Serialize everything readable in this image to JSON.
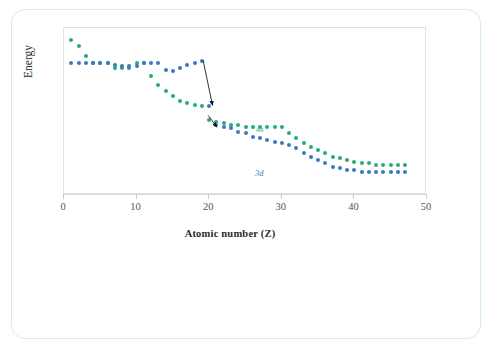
{
  "card": {
    "border_color": "#cfeeee"
  },
  "chart_data": {
    "type": "scatter",
    "title": "",
    "subtitle": "",
    "xlabel": "Atomic number (Z)",
    "ylabel": "Energy",
    "xlim": [
      0,
      50
    ],
    "ylim": [
      0,
      100
    ],
    "xticks": [
      0,
      10,
      20,
      30,
      40,
      50
    ],
    "xtick_labels": [
      "0",
      "10",
      "20",
      "30",
      "40",
      "50"
    ],
    "yticks": [],
    "ytick_labels": [],
    "grid": false,
    "legend_position": "inline-annotations",
    "series": [
      {
        "name": "4s",
        "label": "4s",
        "color": "#2aa87e",
        "marker": "circle",
        "x": [
          1,
          2,
          3,
          4,
          5,
          6,
          7,
          8,
          9,
          10,
          11,
          12,
          13,
          14,
          15,
          16,
          17,
          18,
          19,
          20,
          21,
          22,
          23,
          24,
          25,
          26,
          27,
          28,
          29,
          30,
          31,
          32,
          33,
          34,
          35,
          36,
          37,
          38,
          39,
          40,
          41,
          42,
          43,
          44,
          45,
          46,
          47
        ],
        "y": [
          93,
          89,
          83,
          79,
          79,
          79,
          76,
          76,
          76,
          79,
          79,
          71,
          66,
          62,
          59,
          56,
          55,
          54,
          53,
          45,
          44,
          43,
          42,
          42,
          41,
          41,
          41,
          41,
          41,
          41,
          37,
          34,
          31,
          29,
          27,
          25,
          23,
          22,
          21,
          20,
          19,
          19,
          18,
          18,
          18,
          18,
          18
        ]
      },
      {
        "name": "3d",
        "label": "3d",
        "color": "#3a79c2",
        "marker": "circle",
        "x": [
          1,
          2,
          3,
          4,
          5,
          6,
          7,
          8,
          9,
          10,
          11,
          12,
          13,
          14,
          15,
          16,
          17,
          18,
          19,
          20,
          21,
          22,
          23,
          24,
          25,
          26,
          27,
          28,
          29,
          30,
          31,
          32,
          33,
          34,
          35,
          36,
          37,
          38,
          39,
          40,
          41,
          42,
          43,
          44,
          45,
          46,
          47
        ],
        "y": [
          79,
          79,
          79,
          79,
          79,
          79,
          78,
          77,
          77,
          77,
          79,
          79,
          79,
          75,
          74,
          76,
          78,
          79,
          80,
          53,
          42,
          41,
          40,
          38,
          37,
          35,
          34,
          33,
          32,
          31,
          30,
          28,
          25,
          23,
          21,
          19,
          17,
          16,
          15,
          15,
          14,
          14,
          14,
          14,
          14,
          14,
          14
        ]
      }
    ],
    "annotations": [
      {
        "name": "arrow-3d-drop",
        "from_x": 19.3,
        "from_y": 80,
        "to_x": 20.6,
        "to_y": 53
      },
      {
        "name": "arrow-4s-drop",
        "from_x": 20.0,
        "from_y": 47,
        "to_x": 21.2,
        "to_y": 40
      }
    ]
  },
  "labels": {
    "x_axis_title": "Atomic number (Z)",
    "y_axis_title": "Energy",
    "series_4s": "4s",
    "series_3d": "3d"
  }
}
